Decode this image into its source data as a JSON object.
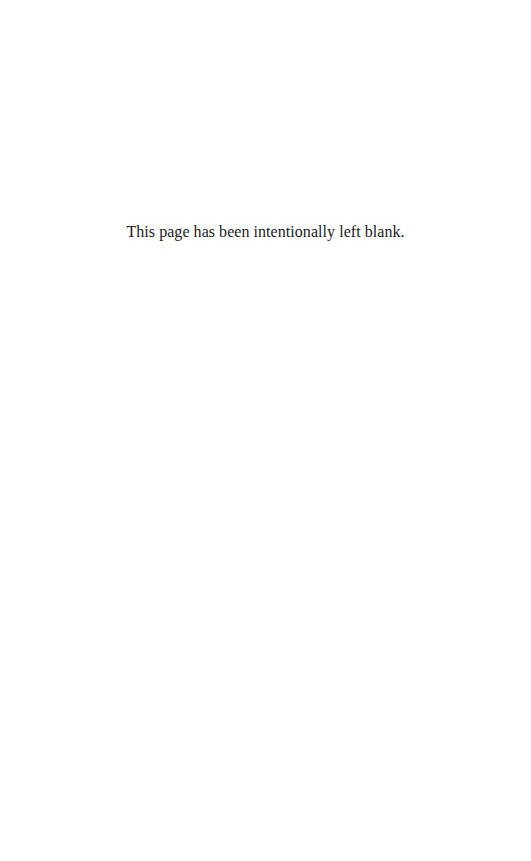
{
  "page": {
    "notice": "This page has been intentionally left blank."
  }
}
